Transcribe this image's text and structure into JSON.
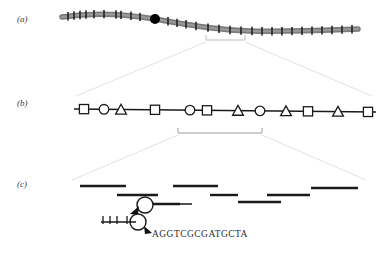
{
  "figure": {
    "type": "genomic-map-diagram",
    "background_color": "#ffffff",
    "width": 379,
    "height": 255,
    "panels": [
      {
        "id": "a",
        "label": "(a)",
        "name": "chromosome-panel",
        "description": "Chromosome ideogram with centromere and cytogenetic band tick marks"
      },
      {
        "id": "b",
        "label": "(b)",
        "name": "marker-map-panel",
        "description": "Genetic / physical marker map with square, circle and triangle markers along a line"
      },
      {
        "id": "c",
        "label": "(c)",
        "name": "contig-sequence-panel",
        "description": "Overlapping sequence contigs, restriction map detail and DNA base sequence"
      }
    ]
  },
  "panel_a": {
    "label": "(a)",
    "chromosome_color": "#777777",
    "tick_color": "#1a1a1a",
    "centromere_color": "#000000",
    "centromere_x": 155,
    "tick_positions": [
      68,
      74,
      80,
      86,
      94,
      104,
      116,
      121,
      131,
      140,
      168,
      177,
      186,
      196,
      208,
      219,
      230,
      241,
      252,
      262,
      272,
      282,
      292,
      302,
      312,
      322,
      332,
      342,
      352
    ],
    "bracket": {
      "x_start": 206,
      "x_end": 245,
      "y": 40
    }
  },
  "panel_b": {
    "label": "(b)",
    "line_color": "#1a1a1a",
    "marker_fill": "#ffffff",
    "marker_stroke": "#1a1a1a",
    "markers": [
      {
        "shape": "square",
        "x": 84
      },
      {
        "shape": "circle",
        "x": 104
      },
      {
        "shape": "triangle",
        "x": 121
      },
      {
        "shape": "square",
        "x": 155
      },
      {
        "shape": "circle",
        "x": 190
      },
      {
        "shape": "square",
        "x": 207
      },
      {
        "shape": "triangle",
        "x": 238
      },
      {
        "shape": "circle",
        "x": 260
      },
      {
        "shape": "triangle",
        "x": 286
      },
      {
        "shape": "square",
        "x": 308
      },
      {
        "shape": "triangle",
        "x": 338
      },
      {
        "shape": "square",
        "x": 368
      }
    ],
    "bracket": {
      "x_start": 178,
      "x_end": 262,
      "y": 133
    }
  },
  "panel_c": {
    "label": "(c)",
    "contig_color": "#1a1a1a",
    "contigs": [
      {
        "x_start": 80,
        "x_end": 126,
        "y": 186
      },
      {
        "x_start": 117,
        "x_end": 158,
        "y": 195
      },
      {
        "x_start": 173,
        "x_end": 218,
        "y": 186
      },
      {
        "x_start": 210,
        "x_end": 238,
        "y": 195
      },
      {
        "x_start": 238,
        "x_end": 281,
        "y": 202
      },
      {
        "x_start": 267,
        "x_end": 310,
        "y": 195
      },
      {
        "x_start": 311,
        "x_end": 358,
        "y": 188
      },
      {
        "x_start": 140,
        "x_end": 180,
        "y": 204
      }
    ],
    "magnifier_top": {
      "cx": 145,
      "cy": 205,
      "r": 8
    },
    "magnifier_bottom": {
      "cx": 138,
      "cy": 222,
      "r": 8
    },
    "restriction_map": {
      "x_start": 101,
      "x_end": 138,
      "y": 222,
      "tick_positions": [
        103,
        110,
        117,
        127
      ]
    },
    "sequence": "AGGTCGCGATGCTA",
    "sequence_color": "#2b2b2b"
  },
  "connectors": {
    "color": "#e2e2e2",
    "ab_left": {
      "x1": 206,
      "y1": 42,
      "x2": 76,
      "y2": 96
    },
    "ab_right": {
      "x1": 245,
      "y1": 42,
      "x2": 372,
      "y2": 96
    },
    "bc_left": {
      "x1": 178,
      "y1": 135,
      "x2": 72,
      "y2": 180
    },
    "bc_right": {
      "x1": 262,
      "y1": 135,
      "x2": 366,
      "y2": 180
    }
  }
}
